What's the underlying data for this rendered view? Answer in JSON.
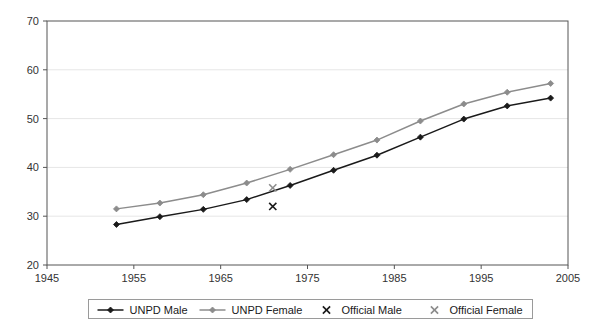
{
  "chart_data": {
    "type": "line",
    "title": "",
    "subtitle": "",
    "xlabel": "",
    "ylabel": "",
    "xlim": [
      1945,
      2005
    ],
    "ylim": [
      20,
      70
    ],
    "xticks": [
      1945,
      1955,
      1965,
      1975,
      1985,
      1995,
      2005
    ],
    "yticks": [
      20,
      30,
      40,
      50,
      60,
      70
    ],
    "grid": "horizontal",
    "legend_position": "bottom",
    "series": [
      {
        "name": "UNPD Male",
        "style": "line-marker",
        "color": "#1a1a1a",
        "marker": "diamond",
        "x": [
          1953,
          1958,
          1963,
          1968,
          1973,
          1978,
          1983,
          1988,
          1993,
          1998,
          2003
        ],
        "values": [
          28.3,
          29.9,
          31.4,
          33.4,
          36.3,
          39.4,
          42.5,
          46.2,
          49.9,
          52.6,
          54.2
        ]
      },
      {
        "name": "UNPD Female",
        "style": "line-marker",
        "color": "#8c8c8c",
        "marker": "diamond",
        "x": [
          1953,
          1958,
          1963,
          1968,
          1973,
          1978,
          1983,
          1988,
          1993,
          1998,
          2003
        ],
        "values": [
          31.5,
          32.7,
          34.4,
          36.8,
          39.6,
          42.6,
          45.6,
          49.5,
          53.0,
          55.4,
          57.2
        ]
      },
      {
        "name": "Official Male",
        "style": "marker-only",
        "color": "#1a1a1a",
        "marker": "x",
        "x": [
          1971
        ],
        "values": [
          32.0
        ]
      },
      {
        "name": "Official Female",
        "style": "marker-only",
        "color": "#8c8c8c",
        "marker": "x",
        "x": [
          1971
        ],
        "values": [
          35.8
        ]
      }
    ]
  },
  "legend": {
    "entries": [
      {
        "label": "UNPD Male"
      },
      {
        "label": "UNPD Female"
      },
      {
        "label": "Official Male"
      },
      {
        "label": "Official Female"
      }
    ]
  },
  "axis": {
    "x_tick_labels": [
      "1945",
      "1955",
      "1965",
      "1975",
      "1985",
      "1995",
      "2005"
    ],
    "y_tick_labels": [
      "20",
      "30",
      "40",
      "50",
      "60",
      "70"
    ]
  },
  "colors": {
    "male": "#1a1a1a",
    "female": "#8c8c8c",
    "axis": "#555555",
    "grid": "#e6e6e6",
    "background": "#ffffff"
  }
}
